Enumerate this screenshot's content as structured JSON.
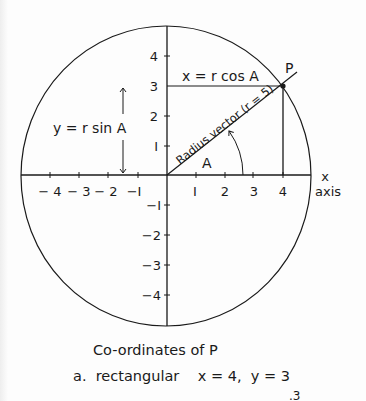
{
  "figure": {
    "circle": {
      "cx": 166,
      "cy": 176,
      "rx": 145,
      "ry": 150,
      "radius_units": 5
    },
    "x_axis": {
      "label_line1": "x",
      "label_line2": "axis",
      "ticks": [
        {
          "value": -4,
          "label": "− 4",
          "px": 50
        },
        {
          "value": -3,
          "label": "− 3",
          "px": 79
        },
        {
          "value": -2,
          "label": "− 2",
          "px": 108
        },
        {
          "value": -1,
          "label": "−I",
          "px": 138
        },
        {
          "value": 1,
          "label": "I",
          "px": 196
        },
        {
          "value": 2,
          "label": "2",
          "px": 225
        },
        {
          "value": 3,
          "label": "3",
          "px": 253
        },
        {
          "value": 4,
          "label": "4",
          "px": 283
        }
      ]
    },
    "y_axis": {
      "ticks": [
        {
          "value": 4,
          "label": "4",
          "py": 56
        },
        {
          "value": 3,
          "label": "3",
          "py": 86
        },
        {
          "value": 2,
          "label": "2",
          "py": 116
        },
        {
          "value": 1,
          "label": "I",
          "py": 146
        },
        {
          "value": -1,
          "label": "−I",
          "py": 205
        },
        {
          "value": -2,
          "label": "−2",
          "py": 235
        },
        {
          "value": -3,
          "label": "−3",
          "py": 265
        },
        {
          "value": -4,
          "label": "−4",
          "py": 295
        }
      ]
    },
    "point": {
      "label": "P",
      "x": 4,
      "y": 3
    },
    "radius_vector_label": "Radius vector (r = 5)",
    "angle_label": "A",
    "x_formula": "x = r cos A",
    "y_formula": "y = r sin A"
  },
  "caption": {
    "title": "Co-ordinates of P",
    "line_a": "a.  rectangular    x = 4,  y = 3",
    "clipped_fragment": ".3"
  }
}
